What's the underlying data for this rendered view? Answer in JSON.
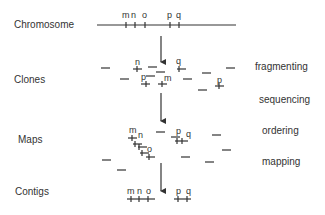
{
  "rows": {
    "chromosome": "Chromosome",
    "clones": "Clones",
    "maps": "Maps",
    "contigs": "Contigs"
  },
  "steps": {
    "fragmenting": "fragmenting",
    "sequencing": "sequencing",
    "ordering": "ordering",
    "mapping": "mapping"
  },
  "markers": {
    "chromosome": [
      "m",
      "n",
      "o",
      "p",
      "q"
    ],
    "clones": [
      "n",
      "q",
      "p",
      "m",
      "p"
    ],
    "maps": [
      "m",
      "n",
      "o",
      "p",
      "q"
    ],
    "contigs": [
      "m",
      "n",
      "o",
      "p",
      "q"
    ]
  },
  "colors": {
    "ink": "#333333",
    "background": "#ffffff"
  }
}
